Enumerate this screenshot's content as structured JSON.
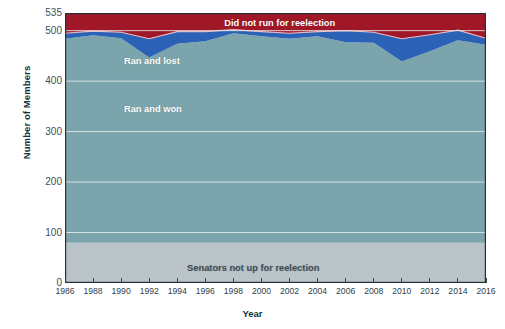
{
  "chart_data": {
    "type": "area",
    "title": "",
    "xlabel": "Year",
    "ylabel": "Number of Members",
    "xlim": [
      1986,
      2016
    ],
    "ylim": [
      0,
      535
    ],
    "yticks": [
      0,
      100,
      200,
      300,
      400,
      500,
      535
    ],
    "ytick_labels": [
      "0",
      "100",
      "200",
      "300",
      "400",
      "500",
      "535"
    ],
    "gridlines": [
      100,
      200,
      300,
      400,
      500
    ],
    "grid": true,
    "legend_position": "in-plot-labels",
    "stacked": true,
    "x": [
      1986,
      1988,
      1990,
      1992,
      1994,
      1996,
      1998,
      2000,
      2002,
      2004,
      2006,
      2008,
      2010,
      2012,
      2014,
      2016
    ],
    "xtick_labels": [
      "1986",
      "1988",
      "1990",
      "1992",
      "1994",
      "1996",
      "1998",
      "2000",
      "2002",
      "2004",
      "2006",
      "2008",
      "2010",
      "2012",
      "2014",
      "2016"
    ],
    "series": [
      {
        "name": "Senators not up for reelection",
        "color": "#b9c3c8",
        "label_color": "#3f5159",
        "values": [
          80,
          80,
          80,
          80,
          80,
          80,
          80,
          80,
          80,
          80,
          80,
          80,
          80,
          80,
          80,
          80
        ]
      },
      {
        "name": "Ran and won",
        "color": "#7ba4ac",
        "label_color": "#ffffff",
        "values": [
          404,
          411,
          405,
          367,
          394,
          399,
          415,
          409,
          404,
          409,
          397,
          396,
          359,
          379,
          401,
          392
        ]
      },
      {
        "name": "Ran and lost",
        "color": "#2b62b5",
        "label_color": "#ffffff",
        "values": [
          11,
          8,
          12,
          37,
          24,
          19,
          7,
          9,
          11,
          9,
          23,
          21,
          45,
          33,
          20,
          13
        ]
      },
      {
        "name": "Did not run for reelection",
        "color": "#a01728",
        "label_color": "#ffffff",
        "values": [
          40,
          36,
          38,
          51,
          37,
          37,
          33,
          37,
          40,
          37,
          35,
          38,
          51,
          43,
          34,
          50
        ]
      }
    ],
    "series_labels": [
      {
        "text": "Did not run for reelection",
        "x_pct": 51,
        "y_px": 20
      },
      {
        "text": "Ran and lost",
        "x_pct": 22,
        "y_px": 58
      },
      {
        "text": "Ran and won",
        "x_pct": 22,
        "y_px": 105
      },
      {
        "text": "Senators not up for reelection",
        "x_pct": 41,
        "y_px": 266
      }
    ]
  }
}
